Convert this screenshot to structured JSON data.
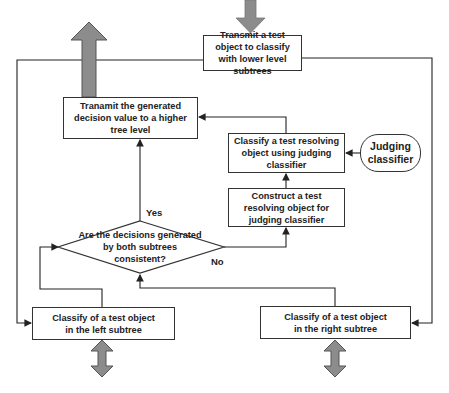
{
  "diagram": {
    "nodes": {
      "transmit_down": {
        "text": "Transmit a test object to classify with lower level subtrees"
      },
      "transmit_up": {
        "text": "Tranamit the generated decision value to a higher tree level"
      },
      "classify_resolving": {
        "text": "Classify a test resolving object using judging classifier"
      },
      "judging_classifier": {
        "text": "Judging classifier"
      },
      "construct_resolving": {
        "text": "Construct a test resolving object for judging classifier"
      },
      "decision": {
        "text": "Are the decisions generated by both subtrees consistent?"
      },
      "classify_left": {
        "text": "Classify of a test object in the left subtree"
      },
      "classify_right": {
        "text": "Classify of a test object in the right subtree"
      }
    },
    "edge_labels": {
      "yes": "Yes",
      "no": "No"
    },
    "colors": {
      "line": "#222222",
      "block_arrow_fill": "#8c8c8c",
      "block_arrow_stroke": "#555555",
      "box_border": "#333333"
    }
  }
}
